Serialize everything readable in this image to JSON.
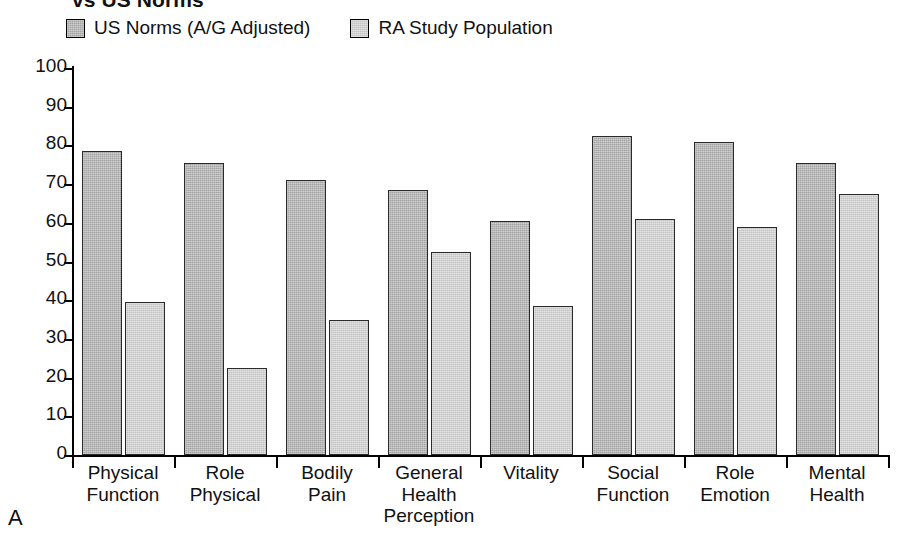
{
  "figure": {
    "panel_letter": "A",
    "title": "vs US Norms"
  },
  "legend": {
    "position": "top-left",
    "items": [
      {
        "label": "US Norms (A/G Adjusted)",
        "color": "#a3a3a3"
      },
      {
        "label": "RA Study Population",
        "color": "#c3c3c3"
      }
    ]
  },
  "axis": {
    "y_ticks": [
      "100",
      "90",
      "80",
      "70",
      "60",
      "50",
      "40",
      "30",
      "20",
      "10",
      "0"
    ]
  },
  "chart_data": {
    "type": "bar",
    "title": "vs US Norms",
    "xlabel": "",
    "ylabel": "",
    "ylim": [
      0,
      100
    ],
    "ytick_step": 10,
    "grid": false,
    "legend_position": "top-left",
    "categories": [
      "Physical Function",
      "Role Physical",
      "Bodily Pain",
      "General Health Perception",
      "Vitality",
      "Social Function",
      "Role Emotion",
      "Mental Health"
    ],
    "category_lines": [
      [
        "Physical",
        "Function"
      ],
      [
        "Role",
        "Physical"
      ],
      [
        "Bodily",
        "Pain"
      ],
      [
        "General",
        "Health",
        "Perception"
      ],
      [
        "Vitality"
      ],
      [
        "Social",
        "Function"
      ],
      [
        "Role",
        "Emotion"
      ],
      [
        "Mental",
        "Health"
      ]
    ],
    "series": [
      {
        "name": "US Norms (A/G Adjusted)",
        "color": "#a3a3a3",
        "values": [
          78.5,
          75.5,
          71.0,
          68.5,
          60.5,
          82.5,
          81.0,
          75.5
        ]
      },
      {
        "name": "RA Study Population",
        "color": "#c3c3c3",
        "values": [
          39.5,
          22.5,
          35.0,
          52.5,
          38.5,
          61.0,
          59.0,
          67.5
        ]
      }
    ]
  }
}
